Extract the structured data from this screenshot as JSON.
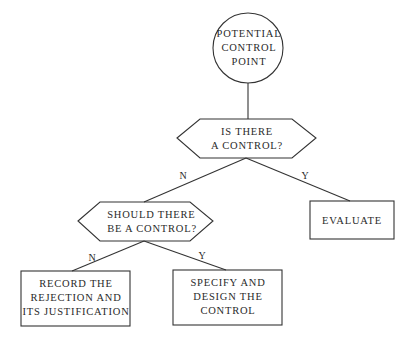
{
  "diagram": {
    "type": "flowchart",
    "stroke_color": "#333333",
    "nodes": [
      {
        "id": "start",
        "shape": "circle",
        "text": "POTENTIAL\nCONTROL\nPOINT"
      },
      {
        "id": "q1",
        "shape": "hexagon",
        "text": "IS THERE\nA CONTROL?"
      },
      {
        "id": "q2",
        "shape": "hexagon",
        "text": "SHOULD THERE\nBE A CONTROL?"
      },
      {
        "id": "evaluate",
        "shape": "rectangle",
        "text": "EVALUATE"
      },
      {
        "id": "record",
        "shape": "rectangle",
        "text": "RECORD THE\nREJECTION AND\nITS JUSTIFICATION"
      },
      {
        "id": "specify",
        "shape": "rectangle",
        "text": "SPECIFY AND\nDESIGN THE\nCONTROL"
      }
    ],
    "edges": [
      {
        "from": "start",
        "to": "q1",
        "label": ""
      },
      {
        "from": "q1",
        "to": "q2",
        "label": "N"
      },
      {
        "from": "q1",
        "to": "evaluate",
        "label": "Y"
      },
      {
        "from": "q2",
        "to": "record",
        "label": "N"
      },
      {
        "from": "q2",
        "to": "specify",
        "label": "Y"
      }
    ]
  }
}
